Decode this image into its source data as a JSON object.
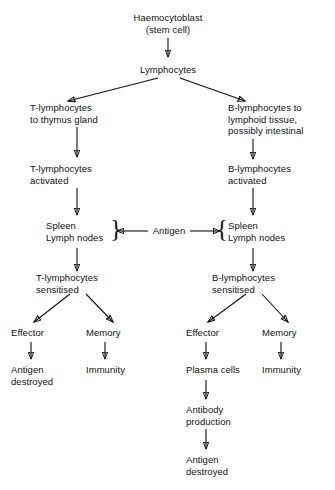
{
  "diagram": {
    "background_color": "#ffffff",
    "line_color": "#111111",
    "nodes": {
      "haemocytoblast": "Haemocytoblast\n(stem cell)",
      "lymphocytes": "Lymphocytes",
      "t_thymus": "T-lymphocytes\nto thymus gland",
      "b_lymphoid": "B-lymphocytes to\nlymphoid tissue,\npossibly intestinal",
      "t_activated": "T-lymphocytes\nactivated",
      "b_activated": "B-lymphocytes\nactivated",
      "t_spleen": "Spleen\nLymph nodes",
      "b_spleen": "Spleen\nLymph nodes",
      "antigen": "Antigen",
      "t_sensitised": "T-lymphocytes\nsensitised",
      "b_sensitised": "B-lymphocytes\nsensitised",
      "t_effector": "Effector",
      "t_memory": "Memory",
      "b_effector": "Effector",
      "b_memory": "Memory",
      "t_antigen_destroyed": "Antigen\ndestroyed",
      "t_immunity": "Immunity",
      "plasma_cells": "Plasma cells",
      "antibody_production": "Antibody\nproduction",
      "b_antigen_destroyed": "Antigen\ndestroyed",
      "b_immunity": "Immunity"
    },
    "braces": {
      "left_group": "}",
      "right_group": "{"
    }
  }
}
